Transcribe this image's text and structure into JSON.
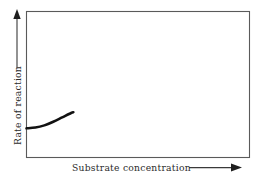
{
  "figure": {
    "title": "",
    "background_color": "#ffffff",
    "frame_color": "#5a5a5a",
    "curve_color": "#121212",
    "text_color": "#2b2b2b",
    "x_axis": {
      "label": "Substrate concentration",
      "arrow": "arrow-right",
      "ticks": [],
      "tick_labels": []
    },
    "y_axis": {
      "label": "Rate of reaction",
      "arrow": "arrow-up",
      "ticks": [],
      "tick_labels": []
    }
  },
  "chart_data": {
    "type": "line",
    "title": "",
    "xlabel": "Substrate concentration",
    "ylabel": "Rate of reaction",
    "xlim": [
      0,
      100
    ],
    "ylim": [
      0,
      100
    ],
    "grid": false,
    "legend": null,
    "annotations": [],
    "series": [
      {
        "name": "Rate of reaction vs substrate concentration",
        "comment": "Short rising curve occupying only the lower-left portion of the plot frame; starts flat at the y-axis and curves upward, ending partway along the lower left region.",
        "x": [
          0,
          4,
          8,
          12,
          16,
          20,
          21
        ],
        "y": [
          20,
          20.5,
          22,
          24.5,
          27.5,
          30.5,
          31
        ]
      }
    ]
  }
}
